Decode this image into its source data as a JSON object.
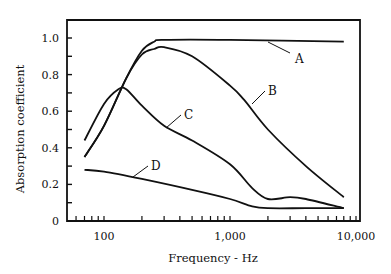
{
  "chart_data": {
    "type": "line",
    "title": "",
    "xlabel": "Frequency - Hz",
    "ylabel": "Absorption coefficient",
    "xscale": "log",
    "xlim": [
      60,
      10000
    ],
    "ylim": [
      0,
      1.0
    ],
    "grid": false,
    "legend": "inline labels",
    "x_ticks": [
      {
        "value": 100,
        "label": "100"
      },
      {
        "value": 1000,
        "label": "1,000"
      },
      {
        "value": 10000,
        "label": "10,000"
      }
    ],
    "y_ticks": [
      {
        "value": 0,
        "label": "0"
      },
      {
        "value": 0.2,
        "label": "0.2"
      },
      {
        "value": 0.4,
        "label": "0.4"
      },
      {
        "value": 0.6,
        "label": "0.6"
      },
      {
        "value": 0.8,
        "label": "0.8"
      },
      {
        "value": 1.0,
        "label": "1.0"
      }
    ],
    "series": [
      {
        "name": "A",
        "x": [
          70,
          100,
          150,
          200,
          250,
          300,
          1000,
          8000
        ],
        "values": [
          0.35,
          0.52,
          0.78,
          0.93,
          0.98,
          0.99,
          0.99,
          0.98
        ]
      },
      {
        "name": "B",
        "x": [
          70,
          100,
          150,
          200,
          250,
          300,
          500,
          1000,
          1300,
          2000,
          4000,
          8000
        ],
        "values": [
          0.35,
          0.52,
          0.78,
          0.91,
          0.94,
          0.95,
          0.9,
          0.74,
          0.66,
          0.5,
          0.3,
          0.13
        ]
      },
      {
        "name": "C",
        "x": [
          70,
          100,
          130,
          150,
          200,
          300,
          500,
          1000,
          1500,
          2000,
          3000,
          4000,
          8000
        ],
        "values": [
          0.44,
          0.64,
          0.72,
          0.72,
          0.63,
          0.52,
          0.44,
          0.31,
          0.18,
          0.12,
          0.13,
          0.12,
          0.07
        ]
      },
      {
        "name": "D",
        "x": [
          70,
          100,
          200,
          500,
          1000,
          1500,
          2000,
          4000,
          8000
        ],
        "values": [
          0.28,
          0.27,
          0.23,
          0.17,
          0.12,
          0.08,
          0.07,
          0.07,
          0.07
        ]
      }
    ],
    "annotations": [
      {
        "text": "A",
        "series": "A"
      },
      {
        "text": "B",
        "series": "B"
      },
      {
        "text": "C",
        "series": "C"
      },
      {
        "text": "D",
        "series": "D"
      }
    ]
  }
}
